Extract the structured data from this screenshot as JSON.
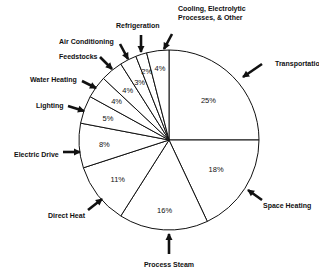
{
  "chart_data": {
    "type": "pie",
    "title": "",
    "start": "top",
    "direction": "clockwise",
    "slices": [
      {
        "label": "Transportation",
        "value": 25,
        "value_label": "25%"
      },
      {
        "label": "Space Heating",
        "value": 18,
        "value_label": "18%"
      },
      {
        "label": "Process Steam",
        "value": 16,
        "value_label": "16%"
      },
      {
        "label": "Direct Heat",
        "value": 11,
        "value_label": "11%"
      },
      {
        "label": "Electric Drive",
        "value": 8,
        "value_label": "8%"
      },
      {
        "label": "Lighting",
        "value": 5,
        "value_label": "5%"
      },
      {
        "label": "Water Heating",
        "value": 4,
        "value_label": "4%"
      },
      {
        "label": "Feedstocks",
        "value": 4,
        "value_label": "4%"
      },
      {
        "label": "Air Conditioning",
        "value": 3,
        "value_label": "3%"
      },
      {
        "label": "Refrigeration",
        "value": 2,
        "value_label": "2%"
      },
      {
        "label": "Cooling, Electrolytic Processes, & Other",
        "label_lines": [
          "Cooling, Electrolytic",
          "Processes, & Other"
        ],
        "value": 4,
        "value_label": "4%"
      }
    ],
    "colors": {
      "fill": "#ffffff",
      "stroke": "#111111",
      "text": "#111111"
    }
  }
}
